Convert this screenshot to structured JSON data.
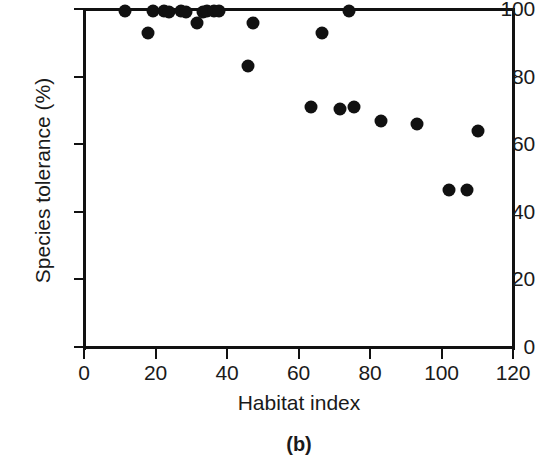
{
  "figure": {
    "panel_label": "(b)",
    "background_color": "#ffffff",
    "marker_color": "#111111",
    "axis_color": "#111111"
  },
  "axes": {
    "y_title": "Species tolerance (%)",
    "x_title": "Habitat index",
    "y_ticks": [
      "0",
      "20",
      "40",
      "60",
      "80",
      "100"
    ],
    "x_ticks": [
      "0",
      "20",
      "40",
      "60",
      "80",
      "100",
      "120"
    ]
  },
  "chart_data": {
    "type": "scatter",
    "title": "",
    "subtitle": "",
    "xlabel": "Habitat index",
    "ylabel": "Species tolerance (%)",
    "xlim": [
      0,
      120
    ],
    "ylim": [
      0,
      100
    ],
    "xticks": [
      0,
      20,
      40,
      60,
      80,
      100,
      120
    ],
    "yticks": [
      0,
      20,
      40,
      60,
      80,
      100
    ],
    "grid": false,
    "legend": null,
    "annotations": [
      {
        "text": "(b)",
        "role": "panel-label",
        "position": "below-axis-center"
      }
    ],
    "series": [
      {
        "name": "Species tolerance vs habitat index",
        "marker": "filled-circle",
        "color": "#111111",
        "points": [
          {
            "x": 11.5,
            "y": 99.5
          },
          {
            "x": 18.0,
            "y": 93.0
          },
          {
            "x": 19.3,
            "y": 99.5
          },
          {
            "x": 22.3,
            "y": 99.5
          },
          {
            "x": 23.7,
            "y": 99.0
          },
          {
            "x": 27.0,
            "y": 99.5
          },
          {
            "x": 28.5,
            "y": 99.0
          },
          {
            "x": 31.5,
            "y": 96.0
          },
          {
            "x": 33.2,
            "y": 99.0
          },
          {
            "x": 34.3,
            "y": 99.5
          },
          {
            "x": 36.3,
            "y": 99.5
          },
          {
            "x": 37.9,
            "y": 99.5
          },
          {
            "x": 45.9,
            "y": 83.0
          },
          {
            "x": 47.2,
            "y": 96.0
          },
          {
            "x": 63.4,
            "y": 71.0
          },
          {
            "x": 66.7,
            "y": 93.0
          },
          {
            "x": 71.7,
            "y": 70.5
          },
          {
            "x": 74.0,
            "y": 99.5
          },
          {
            "x": 75.4,
            "y": 71.0
          },
          {
            "x": 83.2,
            "y": 67.0
          },
          {
            "x": 93.2,
            "y": 66.0
          },
          {
            "x": 102.1,
            "y": 46.5
          },
          {
            "x": 107.2,
            "y": 46.5
          },
          {
            "x": 110.2,
            "y": 64.0
          }
        ]
      }
    ]
  }
}
